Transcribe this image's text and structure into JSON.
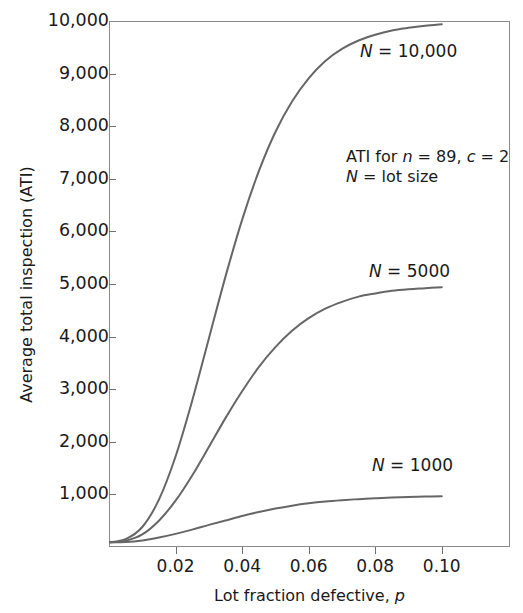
{
  "chart_data": {
    "type": "line",
    "title": "",
    "xlabel": "Lot fraction defective, p",
    "ylabel": "Average total inspection (ATI)",
    "xlim": [
      0,
      0.1205
    ],
    "ylim": [
      0,
      10000
    ],
    "xticks": [
      0.02,
      0.04,
      0.06,
      0.08,
      0.1
    ],
    "xtick_labels": [
      "0.02",
      "0.04",
      "0.06",
      "0.08",
      "0.10"
    ],
    "yticks": [
      1000,
      2000,
      3000,
      4000,
      5000,
      6000,
      7000,
      8000,
      9000,
      10000
    ],
    "ytick_labels": [
      "1,000",
      "2,000",
      "3,000",
      "4,000",
      "5,000",
      "6,000",
      "7,000",
      "8,000",
      "9,000",
      "10,000"
    ],
    "grid": false,
    "legend_position": "inline-curve-labels",
    "annotations": [
      "ATI for n = 89, c = 2",
      "N = lot size"
    ],
    "series": [
      {
        "name": "N = 10,000",
        "label": "N = 10,000",
        "color": "#666666",
        "x": [
          0,
          0.005,
          0.01,
          0.015,
          0.02,
          0.025,
          0.03,
          0.035,
          0.04,
          0.045,
          0.05,
          0.055,
          0.06,
          0.065,
          0.07,
          0.075,
          0.08,
          0.085,
          0.09,
          0.095,
          0.1
        ],
        "y": [
          89,
          150,
          380,
          900,
          1720,
          2780,
          3960,
          5140,
          6220,
          7140,
          7890,
          8470,
          8910,
          9240,
          9470,
          9630,
          9740,
          9820,
          9870,
          9910,
          9940
        ]
      },
      {
        "name": "N = 5000",
        "label": "N = 5000",
        "color": "#666666",
        "x": [
          0,
          0.005,
          0.01,
          0.015,
          0.02,
          0.025,
          0.03,
          0.035,
          0.04,
          0.045,
          0.05,
          0.055,
          0.06,
          0.065,
          0.07,
          0.075,
          0.08,
          0.085,
          0.09,
          0.095,
          0.1
        ],
        "y": [
          89,
          120,
          240,
          500,
          880,
          1360,
          1900,
          2450,
          2960,
          3420,
          3800,
          4110,
          4350,
          4530,
          4660,
          4760,
          4820,
          4870,
          4900,
          4920,
          4940
        ]
      },
      {
        "name": "N = 1000",
        "label": "N = 1000",
        "color": "#666666",
        "x": [
          0,
          0.005,
          0.01,
          0.015,
          0.02,
          0.025,
          0.03,
          0.035,
          0.04,
          0.045,
          0.05,
          0.055,
          0.06,
          0.065,
          0.07,
          0.075,
          0.08,
          0.085,
          0.09,
          0.095,
          0.1
        ],
        "y": [
          89,
          95,
          125,
          180,
          250,
          330,
          420,
          505,
          590,
          665,
          730,
          785,
          830,
          865,
          890,
          910,
          925,
          940,
          950,
          958,
          965
        ]
      }
    ]
  },
  "axes": {
    "y_title": "Average total inspection (ATI)",
    "x_title_prefix": "Lot fraction defective, ",
    "x_title_var": "p"
  },
  "annotation": {
    "line1_prefix": "ATI for ",
    "line1_var_n": "n",
    "line1_mid": " = 89, ",
    "line1_var_c": "c",
    "line1_suffix": " = 2",
    "line2_var_N": "N",
    "line2_suffix": " = lot size"
  },
  "curve_labels": {
    "n10000": {
      "var": "N",
      "text": " = 10,000"
    },
    "n5000": {
      "var": "N",
      "text": " = 5000"
    },
    "n1000": {
      "var": "N",
      "text": " = 1000"
    }
  },
  "style": {
    "curve_color": "#666666",
    "axis_color": "#8a8a8a",
    "text_color": "#1a1a1a",
    "background": "#ffffff"
  }
}
